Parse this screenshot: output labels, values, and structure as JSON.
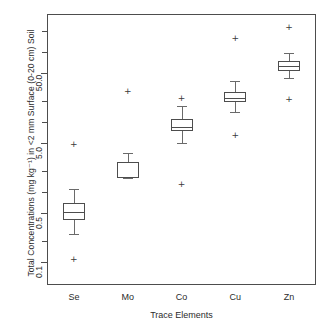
{
  "chart_data": {
    "type": "box",
    "title": "",
    "xlabel": "Trace Elements",
    "ylabel": "Total Concentrations (mg kg⁻¹) in <2 mm Surface (0-20 cm) Soil",
    "categories": [
      "Se",
      "Mo",
      "Co",
      "Cu",
      "Zn"
    ],
    "yscale": "log",
    "ylim": [
      0.085,
      310
    ],
    "ytick_labels": [
      "0.1",
      "0.5",
      "5.0",
      "50.0"
    ],
    "ytick_values": [
      0.1,
      0.5,
      5.0,
      50.0
    ],
    "grid": false,
    "legend": "none",
    "boxes": [
      {
        "category": "Se",
        "whisker_low": 0.25,
        "q1": 0.4,
        "median": 0.52,
        "q3": 0.7,
        "whisker_high": 1.1,
        "outliers": [
          0.11,
          4.8
        ]
      },
      {
        "category": "Mo",
        "whisker_low": 1.6,
        "q1": 1.6,
        "median": 1.65,
        "q3": 2.7,
        "whisker_high": 3.6,
        "outliers": [
          28.0
        ]
      },
      {
        "category": "Co",
        "whisker_low": 5.0,
        "q1": 7.5,
        "median": 8.5,
        "q3": 11.0,
        "whisker_high": 17.0,
        "outliers": [
          1.3,
          22.0
        ]
      },
      {
        "category": "Cu",
        "whisker_low": 14.0,
        "q1": 19.0,
        "median": 22.0,
        "q3": 27.0,
        "whisker_high": 38.0,
        "outliers": [
          6.5,
          160.0
        ]
      },
      {
        "category": "Zn",
        "whisker_low": 42.0,
        "q1": 53.0,
        "median": 62.0,
        "q3": 73.0,
        "whisker_high": 95.0,
        "outliers": [
          21.0,
          230.0
        ]
      }
    ],
    "outlier_marker": "+",
    "colors": {
      "frame": "#4d4d4d",
      "box": "#4d4d4d",
      "whisker": "#6a6a6a",
      "outlier": "#3a3a3a",
      "text": "#2b2b2b",
      "background": "#ffffff"
    }
  }
}
